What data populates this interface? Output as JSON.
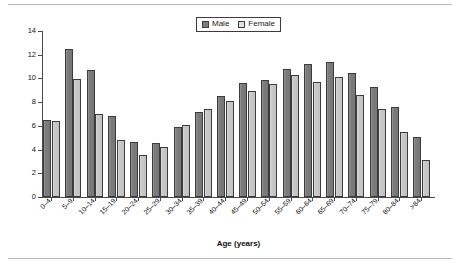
{
  "chart_data": {
    "type": "bar",
    "title": "",
    "xlabel": "Age (years)",
    "ylabel": "Cases per 100,000 population",
    "ylim": [
      0,
      14
    ],
    "yticks": [
      0,
      2,
      4,
      6,
      8,
      10,
      12,
      14
    ],
    "grid": false,
    "legend_position": "top-center",
    "categories": [
      "0–4",
      "5–9",
      "10–14",
      "15–19",
      "20–24",
      "25–29",
      "30–34",
      "35–39",
      "40–44",
      "45–49",
      "50–54",
      "55–59",
      "60–64",
      "65–69",
      "70–74",
      "75–79",
      "80–84",
      ">84"
    ],
    "series": [
      {
        "name": "Male",
        "color": "#7d7d7d",
        "values": [
          6.5,
          12.5,
          10.75,
          6.85,
          4.65,
          4.55,
          5.9,
          7.2,
          8.55,
          9.6,
          9.9,
          10.8,
          11.2,
          11.4,
          10.5,
          9.3,
          7.55,
          5.05
        ]
      },
      {
        "name": "Female",
        "color": "#c9c9c9",
        "values": [
          6.45,
          9.95,
          7.0,
          4.8,
          3.55,
          4.2,
          6.05,
          7.4,
          8.1,
          8.9,
          9.55,
          10.25,
          9.7,
          10.1,
          8.6,
          7.45,
          5.45,
          3.1
        ]
      }
    ]
  },
  "legend": {
    "items": [
      {
        "label": "Male",
        "swatch": "male-swatch"
      },
      {
        "label": "Female",
        "swatch": "female-swatch"
      }
    ]
  }
}
